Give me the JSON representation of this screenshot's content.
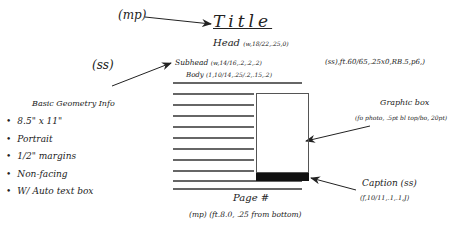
{
  "diagram": {
    "title": "Title",
    "title_marker": "(mp)",
    "head_label": "Head",
    "head_spec": "(w,18/22,.25,0)",
    "subhead_marker": "(ss)",
    "subhead_label": "Subhead",
    "subhead_spec": "(w,14/16,.2,.2,.2)",
    "body_label": "Body",
    "body_spec": "(1,10/14,.25/.2,.15,.2)",
    "right_spec": "(ss),ft.60/65,.25x0,RB.5,p6,)",
    "geometry": {
      "title": "Basic Geometry Info",
      "items": [
        "8.5\" x 11\"",
        "Portrait",
        "1/2\" margins",
        "Non-facing",
        "W/ Auto text box"
      ]
    },
    "graphic_box": {
      "label": "Graphic box",
      "spec": "(fo photo, .5pt bl top/bo, 20pt)"
    },
    "caption": {
      "label": "Caption (ss)",
      "spec": "(f,10/11,.1,.1,J)"
    },
    "page_number": {
      "label": "Page #",
      "spec": "(mp) (ft.8.0, .25 from bottom)"
    }
  }
}
